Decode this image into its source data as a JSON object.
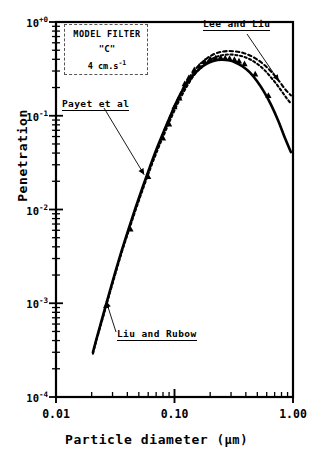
{
  "chart_data": {
    "type": "line",
    "title": "",
    "xlabel": "Particle diameter",
    "xunit": "(µm)",
    "ylabel": "Penetration",
    "xscale": "log",
    "yscale": "log",
    "xlim": [
      0.01,
      1.0
    ],
    "ylim": [
      0.0001,
      1.0
    ],
    "grid": false,
    "legend_position": "top-left-box",
    "xticks": [
      "0.01",
      "0.10",
      "1.00"
    ],
    "xtick_values": [
      0.01,
      0.1,
      1.0
    ],
    "yticks": [
      "10",
      "10",
      "10",
      "10",
      "10"
    ],
    "ytick_exponents": [
      "+0",
      "-1",
      "-2",
      "-3",
      "-4"
    ],
    "ytick_values": [
      1.0,
      0.1,
      0.01,
      0.001,
      0.0001
    ],
    "series": [
      {
        "name": "Payet et al",
        "style": "solid",
        "color": "#000000",
        "x": [
          0.0205,
          0.022,
          0.025,
          0.028,
          0.032,
          0.036,
          0.041,
          0.047,
          0.054,
          0.062,
          0.071,
          0.082,
          0.094,
          0.108,
          0.124,
          0.143,
          0.164,
          0.188,
          0.216,
          0.248,
          0.285,
          0.327,
          0.376,
          0.432,
          0.496,
          0.57,
          0.655,
          0.752,
          0.864,
          0.96
        ],
        "values": [
          0.0003,
          0.00042,
          0.00075,
          0.00125,
          0.00225,
          0.0037,
          0.0062,
          0.0105,
          0.0175,
          0.0285,
          0.045,
          0.07,
          0.105,
          0.155,
          0.21,
          0.27,
          0.32,
          0.36,
          0.385,
          0.395,
          0.39,
          0.37,
          0.335,
          0.29,
          0.235,
          0.18,
          0.13,
          0.088,
          0.056,
          0.041
        ]
      },
      {
        "name": "Liu and Rubow",
        "style": "dotted",
        "color": "#000000",
        "x": [
          0.0205,
          0.022,
          0.025,
          0.028,
          0.032,
          0.036,
          0.041,
          0.047,
          0.054,
          0.062,
          0.071,
          0.082,
          0.094,
          0.108,
          0.124,
          0.143,
          0.164,
          0.188,
          0.216,
          0.248,
          0.285,
          0.327,
          0.376,
          0.432,
          0.496,
          0.57,
          0.655,
          0.752,
          0.864,
          0.96
        ],
        "values": [
          0.00029,
          0.00041,
          0.00072,
          0.0012,
          0.00215,
          0.00355,
          0.0059,
          0.0099,
          0.0164,
          0.0265,
          0.0415,
          0.064,
          0.096,
          0.14,
          0.195,
          0.26,
          0.32,
          0.375,
          0.415,
          0.44,
          0.45,
          0.445,
          0.43,
          0.4,
          0.36,
          0.31,
          0.255,
          0.205,
          0.16,
          0.135
        ]
      },
      {
        "name": "Lee and Liu",
        "style": "dashed-upper",
        "color": "#000000",
        "x": [
          0.082,
          0.094,
          0.108,
          0.124,
          0.143,
          0.164,
          0.188,
          0.216,
          0.248,
          0.285,
          0.327,
          0.376,
          0.432,
          0.496,
          0.57,
          0.655,
          0.752,
          0.864,
          0.96
        ],
        "values": [
          0.07,
          0.105,
          0.155,
          0.22,
          0.29,
          0.355,
          0.41,
          0.455,
          0.48,
          0.49,
          0.485,
          0.47,
          0.44,
          0.4,
          0.35,
          0.295,
          0.24,
          0.19,
          0.165
        ]
      },
      {
        "name": "experimental-points",
        "style": "triangle-markers",
        "color": "#000000",
        "x": [
          0.0265,
          0.0425,
          0.06,
          0.08,
          0.09,
          0.1,
          0.11,
          0.122,
          0.132,
          0.147,
          0.162,
          0.18,
          0.2,
          0.222,
          0.245,
          0.268,
          0.292,
          0.32,
          0.35,
          0.39,
          0.48,
          0.62
        ],
        "values": [
          0.00095,
          0.0062,
          0.0225,
          0.058,
          0.082,
          0.125,
          0.155,
          0.22,
          0.255,
          0.31,
          0.34,
          0.38,
          0.405,
          0.415,
          0.42,
          0.415,
          0.41,
          0.4,
          0.385,
          0.36,
          0.28,
          0.165
        ]
      }
    ],
    "annotations": [
      {
        "id": "lee",
        "text": "Lee and Liu",
        "arrow_to": [
          0.76,
          0.235
        ]
      },
      {
        "id": "payet",
        "text": "Payet et al",
        "arrow_to": [
          0.0555,
          0.0235
        ]
      },
      {
        "id": "liu",
        "text": "Liu and Rubow",
        "arrow_to": [
          0.0265,
          0.00105
        ]
      }
    ],
    "legend_box": {
      "line1": "MODEL FILTER",
      "line2": "\"C\"",
      "line3_value": "4 cm.s",
      "line3_exponent": "-1"
    }
  }
}
